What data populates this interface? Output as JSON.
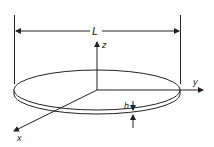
{
  "diagram": {
    "title": "",
    "shape": "thin circular disk",
    "labels": {
      "length": "L",
      "thickness": "h",
      "axis_x": "x",
      "axis_y": "y",
      "axis_z": "z"
    },
    "colors": {
      "stroke": "#222222",
      "background": "#ffffff"
    }
  }
}
